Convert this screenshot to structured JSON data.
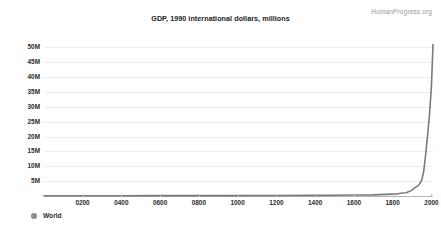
{
  "header": {
    "title": "GDP, 1990 international dollars, millions",
    "watermark": "HumanProgress.org"
  },
  "legend": {
    "items": [
      {
        "label": "World",
        "color": "#8c8c8e",
        "marker": "circle-marker"
      }
    ],
    "position": "bottom-left"
  },
  "colors": {
    "series": "#7a7a7c",
    "gridline": "#ececed",
    "axis": "#b4b4b6",
    "text": "#2b2b2b",
    "watermark": "#9a9a9a",
    "background": "#ffffff"
  },
  "chart_data": {
    "type": "line",
    "title": "GDP, 1990 international dollars, millions",
    "xlabel": "",
    "ylabel": "",
    "xlim": [
      1,
      2008
    ],
    "ylim": [
      0,
      52500000
    ],
    "grid": true,
    "legend_position": "bottom-left",
    "y_ticks": [
      {
        "value": 5000000,
        "label": "5M"
      },
      {
        "value": 10000000,
        "label": "10M"
      },
      {
        "value": 15000000,
        "label": "15M"
      },
      {
        "value": 20000000,
        "label": "20M"
      },
      {
        "value": 25000000,
        "label": "25M"
      },
      {
        "value": 30000000,
        "label": "30M"
      },
      {
        "value": 35000000,
        "label": "35M"
      },
      {
        "value": 40000000,
        "label": "40M"
      },
      {
        "value": 45000000,
        "label": "45M"
      },
      {
        "value": 50000000,
        "label": "50M"
      }
    ],
    "x_ticks": [
      {
        "value": 200,
        "label": "0200"
      },
      {
        "value": 400,
        "label": "0400"
      },
      {
        "value": 600,
        "label": "0600"
      },
      {
        "value": 800,
        "label": "0800"
      },
      {
        "value": 1000,
        "label": "1000"
      },
      {
        "value": 1200,
        "label": "1200"
      },
      {
        "value": 1400,
        "label": "1400"
      },
      {
        "value": 1600,
        "label": "1600"
      },
      {
        "value": 1800,
        "label": "1800"
      },
      {
        "value": 2000,
        "label": "2000"
      }
    ],
    "series": [
      {
        "name": "World",
        "color": "#7a7a7c",
        "x": [
          1,
          200,
          400,
          600,
          800,
          1000,
          1200,
          1400,
          1500,
          1600,
          1700,
          1800,
          1820,
          1850,
          1870,
          1900,
          1913,
          1930,
          1940,
          1950,
          1960,
          1970,
          1980,
          1990,
          2000,
          2008
        ],
        "values": [
          102536,
          105000,
          107000,
          110000,
          115000,
          116790,
          150000,
          210000,
          248321,
          330000,
          371369,
          640000,
          694442,
          1000000,
          1109979,
          1973000,
          2733365,
          3400000,
          4200000,
          5336100,
          8300000,
          13800000,
          20300000,
          27500000,
          37000000,
          50973935
        ]
      }
    ]
  }
}
